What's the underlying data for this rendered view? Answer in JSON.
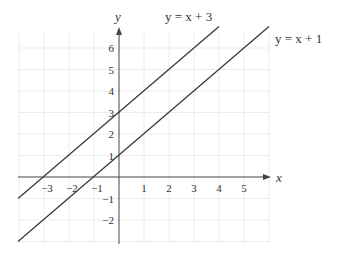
{
  "chart_data": {
    "type": "line",
    "title": "",
    "xlabel": "x",
    "ylabel": "y",
    "xlim": [
      -4,
      6
    ],
    "ylim": [
      -3,
      7
    ],
    "grid": true,
    "x_ticks": [
      -3,
      -2,
      -1,
      1,
      2,
      3,
      4,
      5
    ],
    "x_tick_labels": [
      "−3",
      "−2",
      "−1",
      "1",
      "2",
      "3",
      "4",
      "5"
    ],
    "y_ticks": [
      6,
      5,
      4,
      3,
      2,
      1,
      -1,
      -2
    ],
    "y_tick_labels": [
      "6",
      "5",
      "4",
      "3",
      "2",
      "1",
      "−1",
      "−2"
    ],
    "series": [
      {
        "name": "y = x + 3",
        "equation": "y = x + 3",
        "slope": 1,
        "intercept": 3,
        "x": [
          -4,
          4
        ],
        "y": [
          -1,
          7
        ],
        "y_intercept": [
          0,
          3
        ],
        "x_intercept": [
          -3,
          0
        ]
      },
      {
        "name": "y = x + 1",
        "equation": "y = x + 1",
        "slope": 1,
        "intercept": 1,
        "x": [
          -4,
          6
        ],
        "y": [
          -3,
          7
        ],
        "y_intercept": [
          0,
          1
        ],
        "x_intercept": [
          -1,
          0
        ]
      }
    ],
    "annotations": [
      {
        "text": "y = x + 3",
        "near": "top end of first line"
      },
      {
        "text": "y = x + 1",
        "near": "top end of second line"
      }
    ]
  },
  "colors": {
    "line": "#3a3a3a",
    "axis": "#444444",
    "grid": "#ececec",
    "text": "#333333"
  }
}
